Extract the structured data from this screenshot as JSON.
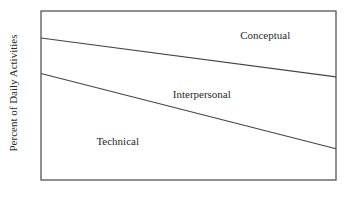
{
  "chart_data": {
    "type": "area",
    "title": "",
    "xlabel": "",
    "ylabel": "Percent of Daily Activities",
    "xlim": [
      0,
      1
    ],
    "ylim": [
      0,
      100
    ],
    "grid": false,
    "legend": "none",
    "boundaries": [
      {
        "name": "technical-interpersonal",
        "x": [
          0,
          1
        ],
        "y": [
          63,
          18.5
        ]
      },
      {
        "name": "interpersonal-conceptual",
        "x": [
          0,
          1
        ],
        "y": [
          84,
          61
        ]
      }
    ],
    "regions": [
      {
        "name": "Technical",
        "label": "Technical",
        "label_pos": [
          0.26,
          23
        ]
      },
      {
        "name": "Interpersonal",
        "label": "Interpersonal",
        "label_pos": [
          0.545,
          51
        ]
      },
      {
        "name": "Conceptual",
        "label": "Conceptual",
        "label_pos": [
          0.76,
          86
        ]
      }
    ]
  }
}
